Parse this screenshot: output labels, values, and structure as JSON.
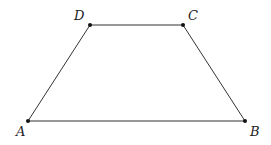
{
  "diagram": {
    "type": "trapezoid",
    "stroke_color": "#333333",
    "point_color": "#111111",
    "vertices": [
      {
        "name": "A",
        "x": 28,
        "y": 121,
        "label_x": 16,
        "label_y": 136
      },
      {
        "name": "B",
        "x": 245,
        "y": 121,
        "label_x": 250,
        "label_y": 136
      },
      {
        "name": "C",
        "x": 183,
        "y": 25,
        "label_x": 188,
        "label_y": 20
      },
      {
        "name": "D",
        "x": 90,
        "y": 25,
        "label_x": 74,
        "label_y": 20
      }
    ],
    "edges": [
      [
        "A",
        "B"
      ],
      [
        "B",
        "C"
      ],
      [
        "C",
        "D"
      ],
      [
        "D",
        "A"
      ]
    ]
  }
}
